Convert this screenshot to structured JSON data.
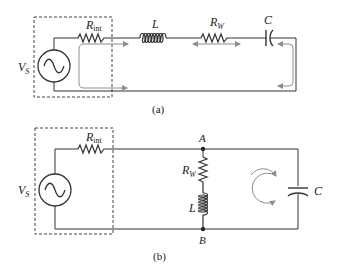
{
  "diagram_a": {
    "caption": "(a)",
    "source_label": "V",
    "source_sub": "S",
    "rint_label": "R",
    "rint_sub": "int",
    "inductor_label": "L",
    "rw_label": "R",
    "rw_sub": "W",
    "cap_label": "C"
  },
  "diagram_b": {
    "caption": "(b)",
    "source_label": "V",
    "source_sub": "S",
    "rint_label": "R",
    "rint_sub": "int",
    "node_a": "A",
    "node_b": "B",
    "rw_label": "R",
    "rw_sub": "W",
    "inductor_label": "L",
    "cap_label": "C"
  },
  "colors": {
    "wire": "#333333",
    "arrow": "#8a8f96",
    "dashed_box": "#444444"
  }
}
